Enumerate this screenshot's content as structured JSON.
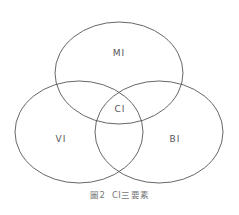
{
  "diagram": {
    "type": "venn",
    "sets": [
      {
        "id": "MI",
        "label": "MI",
        "position": "top"
      },
      {
        "id": "VI",
        "label": "VI",
        "position": "bottom-left"
      },
      {
        "id": "BI",
        "label": "BI",
        "position": "bottom-right"
      }
    ],
    "intersection_label": "CI",
    "caption": "圖2  CI三要素",
    "colors": {
      "stroke": "#555555",
      "text": "#555555",
      "caption": "#777777"
    }
  }
}
